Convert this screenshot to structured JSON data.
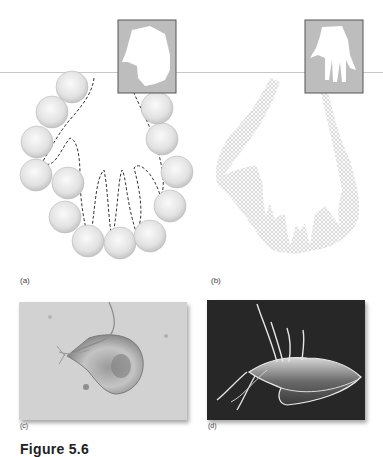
{
  "figure": {
    "panels": [
      {
        "id": "a",
        "label": "(a)",
        "description": "Spheres (cells) surrounding a dashed hand outline; inset shows an irregular white hand-like shape"
      },
      {
        "id": "b",
        "label": "(b)",
        "description": "Many small beads packed around a white hand silhouette; inset shows a hand"
      },
      {
        "id": "c",
        "label": "(c)",
        "description": "Light micrograph of a flagellated protist on grey background"
      },
      {
        "id": "d",
        "label": "(d)",
        "description": "Scanning electron micrograph of a flagellated protist on dark background"
      }
    ],
    "caption": {
      "title": "Figure 5.6",
      "text": "  (caption text cut off)"
    }
  },
  "colors": {
    "inset_fill": "#bdbdbd",
    "inset_border": "#555555",
    "sphere_light": "#f4f4f4",
    "sphere_dark": "#c9c9c9",
    "bead": "#cfcfcf",
    "photo_c_bg": "#cfcfcf",
    "photo_d_bg": "#262626"
  }
}
